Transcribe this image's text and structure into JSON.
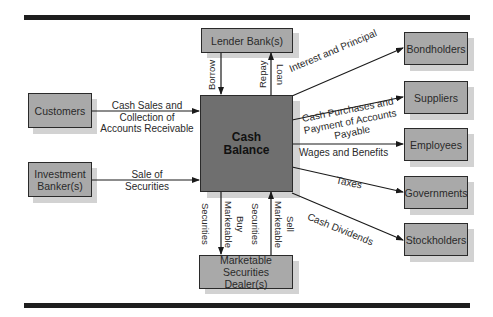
{
  "diagram": {
    "center": {
      "label_line1": "Cash",
      "label_line2": "Balance"
    },
    "sources": [
      {
        "id": "customers",
        "label": "Customers",
        "flow": [
          "Cash Sales and",
          "Collection of",
          "Accounts Receivable"
        ]
      },
      {
        "id": "investment-bankers",
        "label_line1": "Investment",
        "label_line2": "Banker(s)",
        "flow": [
          "Sale of",
          "Securities"
        ]
      }
    ],
    "lender": {
      "label": "Lender Bank(s)",
      "inflow": "Borrow",
      "outflow_line1": "Repay",
      "outflow_line2": "Loan"
    },
    "dealer": {
      "label_line1": "Marketable",
      "label_line2": "Securities Dealer(s)",
      "buy_line1": "Buy",
      "buy_line2": "Marketable",
      "buy_line3": "Securities",
      "sell_line1": "Sell",
      "sell_line2": "Marketable",
      "sell_line3": "Securities"
    },
    "uses": [
      {
        "id": "bondholders",
        "label": "Bondholders",
        "flow": [
          "Interest and Principal"
        ]
      },
      {
        "id": "suppliers",
        "label": "Suppliers",
        "flow": [
          "Cash Purchases and",
          "Payment of Accounts",
          "Payable"
        ]
      },
      {
        "id": "employees",
        "label": "Employees",
        "flow": [
          "Wages and Benefits"
        ]
      },
      {
        "id": "governments",
        "label": "Governments",
        "flow": [
          "Taxes"
        ]
      },
      {
        "id": "stockholders",
        "label": "Stockholders",
        "flow": [
          "Cash Dividends"
        ]
      }
    ],
    "colors": {
      "box": "#a9a9a9",
      "center": "#6f6f6f",
      "shadow": "#d2d2d2",
      "rule": "#1e1e1e"
    }
  }
}
